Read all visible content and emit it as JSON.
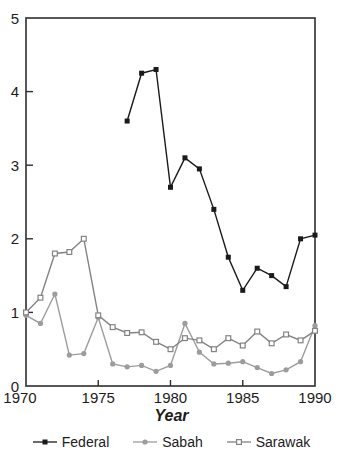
{
  "chart_data": {
    "type": "line",
    "title": "",
    "xlabel": "Year",
    "ylabel": "",
    "xlim": [
      1970,
      1990
    ],
    "ylim": [
      0,
      5
    ],
    "x_ticks": [
      1970,
      1975,
      1980,
      1985,
      1990
    ],
    "y_ticks": [
      0,
      1,
      2,
      3,
      4,
      5
    ],
    "grid": "off",
    "legend_position": "bottom",
    "colors": {
      "axis": "#2e2e2e",
      "text": "#1c1c1c",
      "background": "#ffffff"
    },
    "series": [
      {
        "name": "Federal",
        "marker": "filled-square",
        "color": "#1a1a1a",
        "x": [
          1977,
          1978,
          1979,
          1980,
          1981,
          1982,
          1983,
          1984,
          1985,
          1986,
          1987,
          1988,
          1989,
          1990
        ],
        "values": [
          3.6,
          4.25,
          4.3,
          2.7,
          3.1,
          2.95,
          2.4,
          1.75,
          1.3,
          1.6,
          1.5,
          1.35,
          2.0,
          2.05
        ]
      },
      {
        "name": "Sabah",
        "marker": "filled-circle",
        "color": "#9c9c9c",
        "x": [
          1970,
          1971,
          1972,
          1973,
          1974,
          1975,
          1976,
          1977,
          1978,
          1979,
          1980,
          1981,
          1982,
          1983,
          1984,
          1985,
          1986,
          1987,
          1988,
          1989,
          1990
        ],
        "values": [
          0.96,
          0.85,
          1.25,
          0.42,
          0.44,
          0.93,
          0.3,
          0.26,
          0.28,
          0.2,
          0.28,
          0.85,
          0.46,
          0.3,
          0.31,
          0.33,
          0.25,
          0.17,
          0.22,
          0.33,
          0.82
        ]
      },
      {
        "name": "Sarawak",
        "marker": "open-square",
        "color": "#838383",
        "x": [
          1970,
          1971,
          1972,
          1973,
          1974,
          1975,
          1976,
          1977,
          1978,
          1979,
          1980,
          1981,
          1982,
          1983,
          1984,
          1985,
          1986,
          1987,
          1988,
          1989,
          1990
        ],
        "values": [
          1.0,
          1.2,
          1.8,
          1.82,
          2.0,
          0.96,
          0.8,
          0.72,
          0.73,
          0.6,
          0.5,
          0.65,
          0.62,
          0.5,
          0.65,
          0.55,
          0.74,
          0.58,
          0.7,
          0.62,
          0.75
        ]
      }
    ]
  }
}
